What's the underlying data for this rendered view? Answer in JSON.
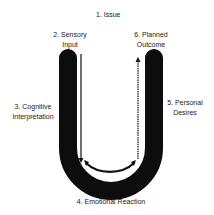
{
  "diagram": {
    "labels": {
      "issue": "1. Issue",
      "sensory_input_1": "2. Sensory",
      "sensory_input_2": "Input",
      "cognitive_1": "3. Cognitive",
      "cognitive_2": "Interpretation",
      "emotional": "4. Emotional Reaction",
      "personal_1": "5. Personal",
      "personal_2": "Desires",
      "planned_1": "6. Planned",
      "planned_2": "Outcome"
    },
    "colors": {
      "u_shape": "#0d0d0d",
      "arrow": "#111111",
      "inner_arc": "#ffffff",
      "background": "#ffffff"
    }
  }
}
